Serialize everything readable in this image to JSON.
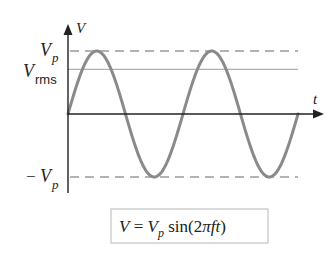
{
  "diagram": {
    "axes": {
      "y_label": "V",
      "x_label": "t"
    },
    "levels": {
      "peak": {
        "label_main": "V",
        "label_sub": "p",
        "value": 1.0,
        "style": "dashed"
      },
      "rms": {
        "label_main": "V",
        "label_sub": "rms",
        "value": 0.707,
        "style": "solid"
      },
      "neg_peak": {
        "label_prefix": "−",
        "label_main": "V",
        "label_sub": "p",
        "value": -1.0,
        "style": "dashed"
      }
    },
    "wave": {
      "function": "sine",
      "cycles": 2,
      "amplitude": 1.0
    },
    "formula": {
      "lhs": "V",
      "eq": " = ",
      "vp_main": "V",
      "vp_sub": "p",
      "fn": " sin",
      "open": "(2",
      "pi": "π",
      "ft": "ft",
      "close": ")"
    },
    "colors": {
      "axis": "#222222",
      "wave": "#8a8a8a",
      "peak_line": "#9a9a9a",
      "rms_line": "#b0b0b0",
      "box_border": "#c8c8c8"
    }
  }
}
